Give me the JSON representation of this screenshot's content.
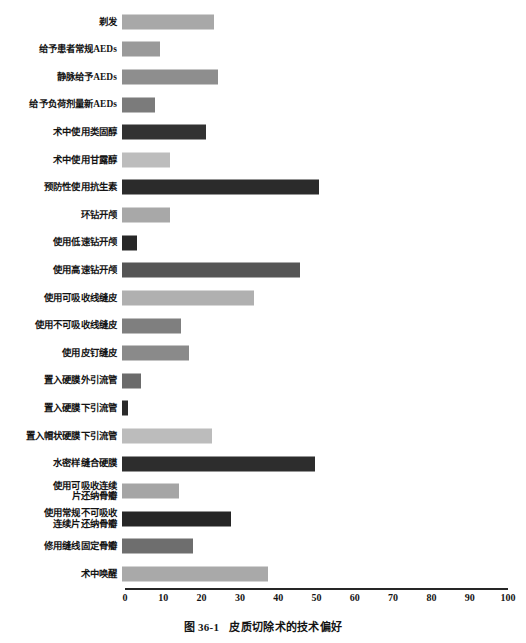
{
  "figure": {
    "caption_number": "图 36-1",
    "caption_text": "皮质切除术的技术偏好"
  },
  "chart_data": {
    "type": "bar",
    "orientation": "horizontal",
    "title": "皮质切除术的技术偏好",
    "xlabel": "",
    "ylabel": "",
    "xlim": [
      0,
      100
    ],
    "xticks": [
      0,
      10,
      20,
      30,
      40,
      50,
      60,
      70,
      80,
      90,
      100
    ],
    "xtick_labels": [
      "0",
      "10",
      "20",
      "30",
      "40",
      "50",
      "60",
      "70",
      "80",
      "90",
      "100"
    ],
    "grid": false,
    "legend": "none",
    "categories": [
      "剃发",
      "给予患者常规AEDs",
      "静脉给予AEDs",
      "给予负荷剂量新AEDs",
      "术中使用类固醇",
      "术中使用甘露醇",
      "预防性使用抗生素",
      "环钻开颅",
      "使用低速钻开颅",
      "使用高速钻开颅",
      "使用可吸收线缝皮",
      "使用不可吸收线缝皮",
      "使用皮钉缝皮",
      "置入硬膜外引流管",
      "置入硬膜下引流管",
      "置入帽状硬膜下引流管",
      "水密样缝合硬膜",
      "使用可吸收连续\n片还纳骨瓣",
      "使用常规不可吸收\n连续片还纳骨瓣",
      "修用缝线固定骨瓣",
      "术中唤醒"
    ],
    "values": [
      24,
      10,
      25,
      8.5,
      22,
      12.5,
      51.5,
      12.5,
      4,
      46.5,
      34.5,
      15.5,
      17.5,
      5,
      1.5,
      23.5,
      50.5,
      15,
      28.5,
      18.5,
      38
    ],
    "bar_colors": [
      "#a8a8a8",
      "#9a9a9a",
      "#8e8e8e",
      "#7b7b7b",
      "#323232",
      "#bdbdbd",
      "#2b2b2b",
      "#a8a8a8",
      "#282828",
      "#555555",
      "#b0b0b0",
      "#7f7f7f",
      "#8a8a8a",
      "#6b6b6b",
      "#2a2a2a",
      "#bcbcbc",
      "#2d2d2d",
      "#a5a5a5",
      "#262626",
      "#6e6e6e",
      "#a9a9a9"
    ]
  },
  "axis": {
    "line_color": "#262626"
  }
}
